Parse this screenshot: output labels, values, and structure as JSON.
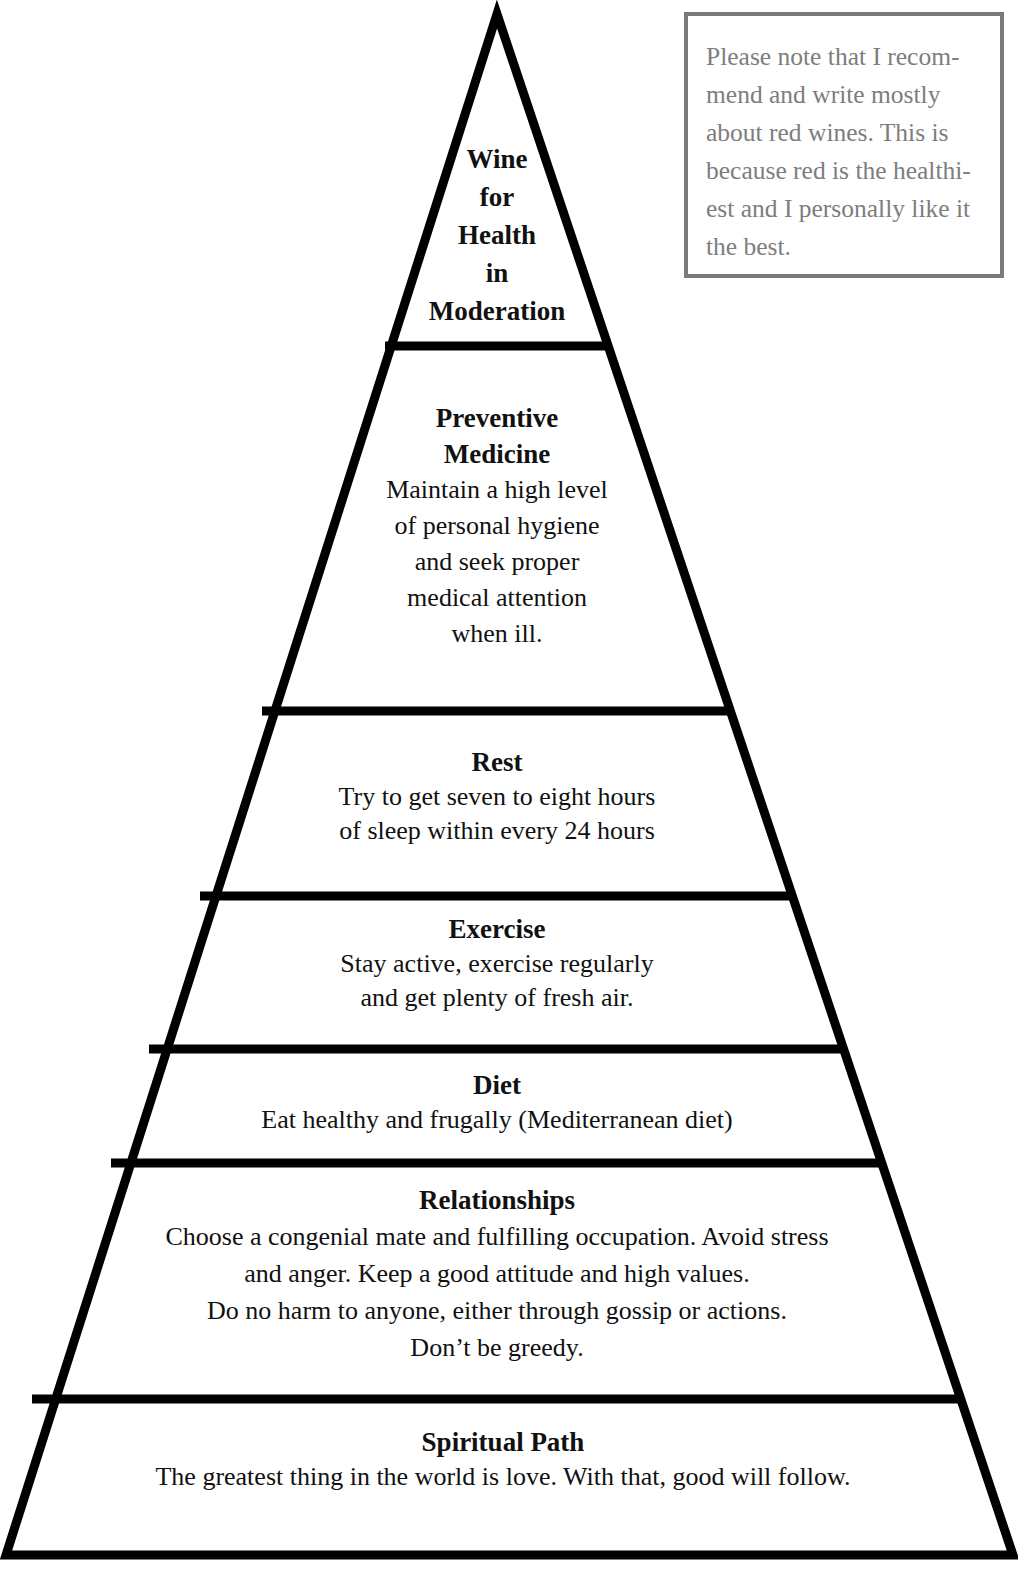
{
  "diagram": {
    "type": "health-pyramid",
    "colors": {
      "outline": "#000000",
      "note_border": "#7a7a7a",
      "note_text": "#7d7d7d",
      "background": "#ffffff"
    },
    "tiers": [
      {
        "title_lines": [
          "Wine",
          "for",
          "Health",
          "in",
          "Moderation"
        ],
        "body_lines": []
      },
      {
        "title_lines": [
          "Preventive",
          "Medicine"
        ],
        "body_lines": [
          "Maintain a high level",
          "of personal hygiene",
          "and seek proper",
          "medical attention",
          "when ill."
        ]
      },
      {
        "title_lines": [
          "Rest"
        ],
        "body_lines": [
          "Try to get  seven to eight hours",
          "of sleep within every 24 hours"
        ]
      },
      {
        "title_lines": [
          "Exercise"
        ],
        "body_lines": [
          "Stay active, exercise regularly",
          "and get plenty of fresh air."
        ]
      },
      {
        "title_lines": [
          "Diet"
        ],
        "body_lines": [
          "Eat healthy and frugally (Mediterranean diet)"
        ]
      },
      {
        "title_lines": [
          "Relationships"
        ],
        "body_lines": [
          "Choose a congenial mate and fulfilling occupation. Avoid stress",
          "and anger. Keep a good attitude and high values.",
          "Do no harm to anyone, either through gossip or actions.",
          "Don’t be greedy."
        ]
      },
      {
        "title_lines": [
          "Spiritual Path"
        ],
        "body_lines": [
          "The greatest thing in the world is love. With that, good will follow."
        ]
      }
    ],
    "note": {
      "lines": [
        "Please note that I recom-",
        "mend and write mostly",
        "about red wines. This is",
        "because red is the healthi-",
        "est and I personally like it",
        "the best."
      ]
    }
  }
}
